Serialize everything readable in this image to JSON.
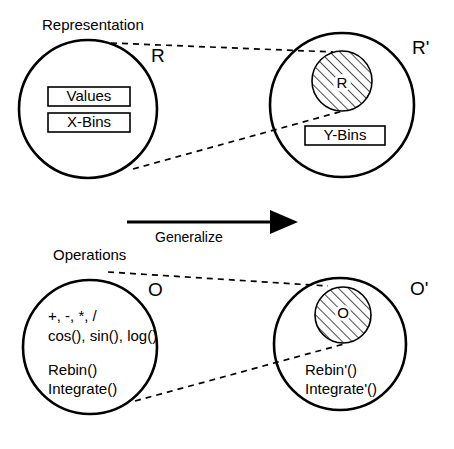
{
  "diagram": {
    "title_top": "Representation",
    "title_bottom": "Operations",
    "arrow_label": "Generalize",
    "top_group": {
      "source": {
        "set_label": "R",
        "boxes": [
          "Values",
          "X-Bins"
        ]
      },
      "target": {
        "set_label": "R'",
        "inner_label": "R",
        "boxes": [
          "Y-Bins"
        ]
      }
    },
    "bottom_group": {
      "source": {
        "set_label": "O",
        "lines": [
          "+, -, *, /",
          "cos(), sin(), log()",
          "Rebin()",
          "Integrate()"
        ]
      },
      "target": {
        "set_label": "O'",
        "inner_label": "O",
        "lines": [
          "Rebin'()",
          "Integrate'()"
        ]
      }
    },
    "colors": {
      "stroke": "#000000",
      "background": "#ffffff",
      "hatch": "#000000"
    }
  }
}
